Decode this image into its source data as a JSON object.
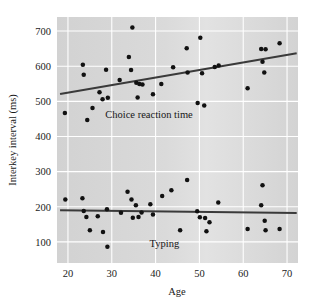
{
  "chart_data": {
    "type": "scatter",
    "title": "",
    "xlabel": "Age",
    "ylabel": "Interkey interval (ms)",
    "xlim": [
      17.5,
      72.5
    ],
    "ylim": [
      40,
      740
    ],
    "xticks": [
      20,
      30,
      40,
      50,
      60,
      70
    ],
    "yticks": [
      100,
      200,
      300,
      400,
      500,
      600,
      700
    ],
    "grid": true,
    "grid_color": "#ffffff",
    "plot_background": "#d4d4d4",
    "marker_color": "#111111",
    "trendline_color": "#3a3a3a",
    "legend_position": "inline-annotations",
    "annotations": [
      {
        "text": "Choice reaction time",
        "x": 38.5,
        "y": 452
      },
      {
        "text": "Typing",
        "x": 42.0,
        "y": 86
      }
    ],
    "series": [
      {
        "name": "Choice reaction time",
        "annotation": "Choice reaction time",
        "points": [
          [
            19.3,
            467
          ],
          [
            23.4,
            604
          ],
          [
            23.6,
            576
          ],
          [
            24.4,
            447
          ],
          [
            25.6,
            481
          ],
          [
            27.2,
            526
          ],
          [
            27.9,
            506
          ],
          [
            28.7,
            590
          ],
          [
            29.1,
            510
          ],
          [
            31.8,
            561
          ],
          [
            33.9,
            626
          ],
          [
            34.4,
            589
          ],
          [
            34.7,
            710
          ],
          [
            35.6,
            553
          ],
          [
            35.9,
            511
          ],
          [
            36.3,
            549
          ],
          [
            37.0,
            548
          ],
          [
            39.4,
            520
          ],
          [
            41.3,
            549
          ],
          [
            44.0,
            597
          ],
          [
            47.1,
            651
          ],
          [
            47.3,
            582
          ],
          [
            49.6,
            495
          ],
          [
            50.2,
            681
          ],
          [
            50.6,
            580
          ],
          [
            51.1,
            488
          ],
          [
            53.5,
            598
          ],
          [
            54.4,
            602
          ],
          [
            61.0,
            537
          ],
          [
            64.1,
            649
          ],
          [
            64.4,
            613
          ],
          [
            64.8,
            582
          ],
          [
            65.1,
            648
          ],
          [
            68.3,
            665
          ]
        ],
        "trendline": {
          "x0": 18.2,
          "y0": 521,
          "x1": 72.2,
          "y1": 637
        }
      },
      {
        "name": "Typing",
        "annotation": "Typing",
        "points": [
          [
            19.4,
            221
          ],
          [
            23.3,
            224
          ],
          [
            23.6,
            188
          ],
          [
            24.2,
            171
          ],
          [
            25.0,
            133
          ],
          [
            26.8,
            173
          ],
          [
            28.0,
            128
          ],
          [
            28.9,
            193
          ],
          [
            29.0,
            86
          ],
          [
            32.1,
            183
          ],
          [
            33.6,
            243
          ],
          [
            34.5,
            221
          ],
          [
            34.8,
            169
          ],
          [
            35.5,
            204
          ],
          [
            36.1,
            171
          ],
          [
            36.8,
            184
          ],
          [
            38.8,
            207
          ],
          [
            39.4,
            178
          ],
          [
            41.5,
            231
          ],
          [
            43.6,
            247
          ],
          [
            45.6,
            133
          ],
          [
            47.2,
            276
          ],
          [
            49.5,
            187
          ],
          [
            50.1,
            170
          ],
          [
            51.3,
            168
          ],
          [
            51.6,
            130
          ],
          [
            52.3,
            156
          ],
          [
            54.3,
            212
          ],
          [
            61.0,
            137
          ],
          [
            64.1,
            204
          ],
          [
            64.4,
            261
          ],
          [
            64.9,
            160
          ],
          [
            65.1,
            133
          ],
          [
            68.3,
            137
          ]
        ],
        "trendline": {
          "x0": 18.2,
          "y0": 190,
          "x1": 72.2,
          "y1": 182
        }
      }
    ]
  },
  "axis": {
    "x_title": "Age",
    "y_title": "Interkey interval (ms)",
    "x_tick_labels": [
      "20",
      "30",
      "40",
      "50",
      "60",
      "70"
    ],
    "y_tick_labels": [
      "100",
      "200",
      "300",
      "400",
      "500",
      "600",
      "700"
    ]
  }
}
